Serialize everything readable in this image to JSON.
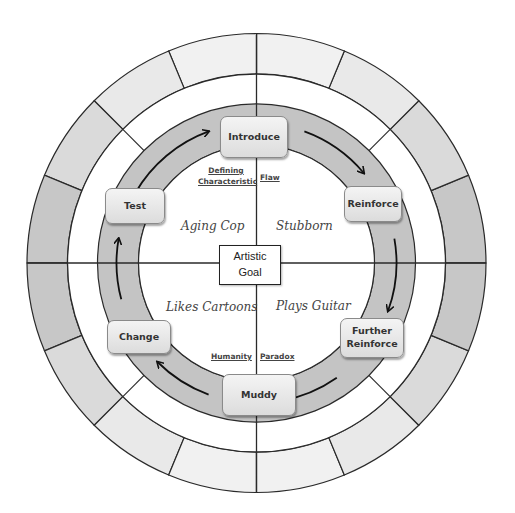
{
  "center_box": {
    "line1": "Artistic",
    "line2": "Goal"
  },
  "stages": {
    "introduce": "Introduce",
    "reinforce": "Reinforce",
    "further_reinforce_line1": "Further",
    "further_reinforce_line2": "Reinforce",
    "muddy": "Muddy",
    "change": "Change",
    "test": "Test"
  },
  "quadrant_labels": {
    "top_left_line1": "Defining",
    "top_left_line2": "Characteristic",
    "top_right": "Flaw",
    "bottom_left": "Humanity",
    "bottom_right": "Paradox"
  },
  "traits": {
    "top_left": "Aging Cop",
    "top_right": "Stubborn",
    "bottom_left": "Likes Cartoons",
    "bottom_right": "Plays Guitar"
  },
  "colors": {
    "band_gray": "#c4c4c4",
    "outer_ring_dark": "#bdbdbd",
    "outer_ring_light": "#f2f2f2",
    "line": "#2a2a2a"
  },
  "outer_ring_segments": 16
}
